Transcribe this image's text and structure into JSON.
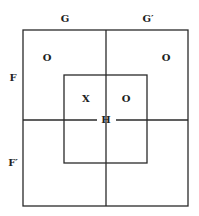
{
  "diagram": {
    "column_labels": [
      "G",
      "G′"
    ],
    "row_labels": [
      "F",
      "F′"
    ],
    "center_label": "H",
    "cell_marks": {
      "outer_FG": "O",
      "outer_FGprime": "O",
      "inner_FG": "X",
      "inner_FGprime": "O"
    },
    "colors": {
      "line": "#2a2a2a",
      "text": "#222222",
      "background": "#ffffff"
    }
  }
}
